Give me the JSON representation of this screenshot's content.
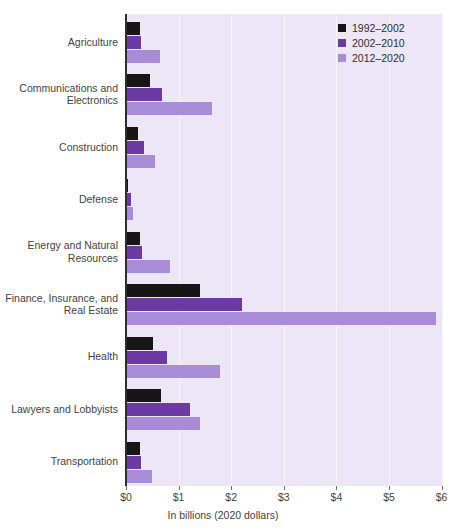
{
  "chart_data": {
    "type": "bar",
    "orientation": "horizontal",
    "title": "",
    "subtitle": "",
    "xlabel": "In billions (2020 dollars)",
    "ylabel": "",
    "xlim": [
      0,
      6
    ],
    "xticks": [
      0,
      1,
      2,
      3,
      4,
      5,
      6
    ],
    "xtick_labels": [
      "$0",
      "$1",
      "$2",
      "$3",
      "$4",
      "$5",
      "$6"
    ],
    "grid": true,
    "legend_position": "top-right",
    "categories": [
      "Agriculture",
      "Communications and\nElectronics",
      "Construction",
      "Defense",
      "Energy and Natural\nResources",
      "Finance, Insurance, and\nReal Estate",
      "Health",
      "Lawyers and Lobbyists",
      "Transportation"
    ],
    "series": [
      {
        "name": "1992–2002",
        "color": "#161616",
        "values": [
          0.27,
          0.45,
          0.23,
          0.04,
          0.26,
          1.4,
          0.52,
          0.67,
          0.27
        ]
      },
      {
        "name": "2002–2010",
        "color": "#6b3ba3",
        "values": [
          0.28,
          0.68,
          0.35,
          0.1,
          0.3,
          2.2,
          0.77,
          1.22,
          0.28
        ]
      },
      {
        "name": "2012–2020",
        "color": "#a88cd8",
        "values": [
          0.65,
          1.63,
          0.55,
          0.14,
          0.83,
          5.9,
          1.78,
          1.4,
          0.5
        ]
      }
    ]
  },
  "colors": {
    "plot_background": "#ece6f6",
    "gridline": "#f7f4fb",
    "axis": "#2e2e2e",
    "text": "#3f3f3f",
    "page_background": "#ffffff"
  }
}
